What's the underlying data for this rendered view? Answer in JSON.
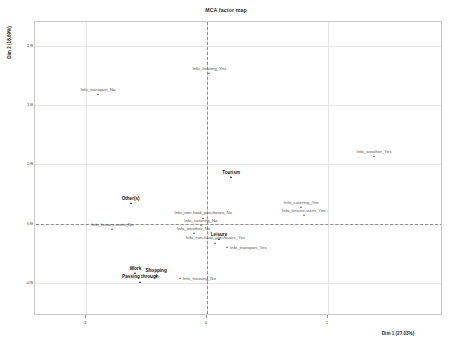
{
  "chart_data": {
    "type": "scatter",
    "title": "MCA factor map",
    "xlabel": "Dim 1 (27.03%)",
    "ylabel": "Dim 2 (16.69%)",
    "xlim": [
      -1.42,
      1.95
    ],
    "ylim": [
      -0.78,
      1.7
    ],
    "xticks": [
      "-1",
      "0",
      "1"
    ],
    "xtick_values": [
      -1,
      0,
      1
    ],
    "yticks": [
      "1.5",
      "1.0",
      "0.5",
      "0.0",
      "-0.5"
    ],
    "ytick_values": [
      1.5,
      1.0,
      0.5,
      0.0,
      -0.5
    ],
    "grid": true,
    "legend": "none",
    "reference_lines": {
      "x": 0,
      "y": 0,
      "style": "dashed"
    },
    "points": [
      {
        "label": "Info_heating_Yes",
        "x": 0.02,
        "y": 1.27,
        "group": "supplementary",
        "label_pos": "top"
      },
      {
        "label": "Info_transport_No",
        "x": -0.9,
        "y": 1.09,
        "group": "supplementary",
        "label_pos": "top"
      },
      {
        "label": "Info_weather_Yes",
        "x": 1.38,
        "y": 0.57,
        "group": "supplementary",
        "label_pos": "top"
      },
      {
        "label": "Tourism",
        "x": 0.2,
        "y": 0.39,
        "group": "active",
        "label_pos": "top"
      },
      {
        "label": "Other(s)",
        "x": -0.63,
        "y": 0.17,
        "group": "active",
        "label_pos": "top"
      },
      {
        "label": "Info_catering_Yes",
        "x": 0.78,
        "y": 0.14,
        "group": "supplementary",
        "label_pos": "top"
      },
      {
        "label": "Info_leisure-visits_Yes",
        "x": 0.8,
        "y": 0.07,
        "group": "supplementary",
        "label_pos": "top"
      },
      {
        "label": "Info_non-food_purchases_No",
        "x": -0.03,
        "y": 0.05,
        "group": "supplementary",
        "label_pos": "top"
      },
      {
        "label": "Info_catering_No",
        "x": -0.05,
        "y": -0.01,
        "group": "supplementary",
        "label_pos": "top"
      },
      {
        "label": "Info_leisure-visits_No",
        "x": -0.78,
        "y": -0.05,
        "group": "supplementary",
        "label_pos": "top"
      },
      {
        "label": "Info_weather_No",
        "x": -0.11,
        "y": -0.08,
        "group": "supplementary",
        "label_pos": "top"
      },
      {
        "label": "Leisure",
        "x": 0.1,
        "y": -0.13,
        "group": "active",
        "label_pos": "top"
      },
      {
        "label": "Info_non-food_purchases_Yes",
        "x": 0.07,
        "y": -0.16,
        "group": "supplementary",
        "label_pos": "top"
      },
      {
        "label": "Info_transport_Yes",
        "x": 0.17,
        "y": -0.2,
        "group": "supplementary",
        "label_pos": "right"
      },
      {
        "label": "Work",
        "x": -0.59,
        "y": -0.42,
        "group": "active",
        "label_pos": "top"
      },
      {
        "label": "Shopping",
        "x": -0.42,
        "y": -0.44,
        "group": "active",
        "label_pos": "top"
      },
      {
        "label": "Info_housing_No",
        "x": -0.22,
        "y": -0.46,
        "group": "supplementary",
        "label_pos": "right"
      },
      {
        "label": "Passing through",
        "x": -0.55,
        "y": -0.49,
        "group": "active",
        "label_pos": "top"
      }
    ]
  },
  "colors": {
    "point": "#6e6e6e",
    "point_active": "#1a1a1a",
    "label": "#555555",
    "label_active": "#111111",
    "grid": "#e6e6e6",
    "panel_border": "#c9c9c9",
    "reference_line": "#8f8f8f",
    "background": "#ffffff"
  }
}
